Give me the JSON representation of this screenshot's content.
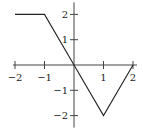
{
  "chart_data": {
    "type": "line",
    "title": "",
    "xlabel": "",
    "ylabel": "",
    "xlim": [
      -2,
      2
    ],
    "ylim": [
      -2,
      2
    ],
    "grid": false,
    "x_ticks": [
      -2,
      -1,
      1,
      2
    ],
    "y_ticks": [
      2,
      1,
      -1,
      -2
    ],
    "x_tick_labels": [
      "−2",
      "−1",
      "1",
      "2"
    ],
    "y_tick_labels": [
      "2",
      "1",
      "−1",
      "−2"
    ],
    "series": [
      {
        "name": "piecewise linear function",
        "x": [
          -2,
          -1,
          0,
          1,
          2
        ],
        "y": [
          2,
          2,
          0,
          -2,
          0
        ]
      }
    ],
    "colors": {
      "line": "#222222",
      "axis": "#444444"
    }
  }
}
